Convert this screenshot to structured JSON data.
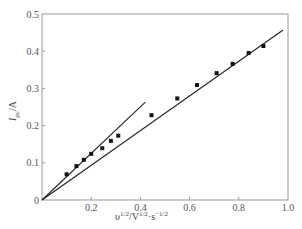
{
  "chart_data": {
    "type": "scatter",
    "title": "",
    "xlabel": "υ^1/2/V^1/2·s^-1/2",
    "ylabel": "I_pc/A",
    "xlabel_parts": {
      "base": "υ",
      "sup1": "1/2",
      "mid": "/V",
      "sup2": "1/2",
      "mid2": "·s",
      "sup3": "−1/2"
    },
    "ylabel_parts": {
      "base": "I",
      "sub": "pc",
      "unit": "/A"
    },
    "xlim": [
      0,
      1.0
    ],
    "ylim": [
      0,
      0.5
    ],
    "xticks": [
      "0",
      "0.2",
      "0.4",
      "0.6",
      "0.8",
      "1.0"
    ],
    "yticks": [
      "0",
      "0.1",
      "0.2",
      "0.3",
      "0.4",
      "0.5"
    ],
    "grid": false,
    "series": [
      {
        "name": "data points",
        "marker": "square",
        "x": [
          0.1,
          0.14,
          0.17,
          0.2,
          0.245,
          0.28,
          0.31,
          0.445,
          0.55,
          0.63,
          0.71,
          0.775,
          0.84,
          0.9
        ],
        "y": [
          0.069,
          0.091,
          0.108,
          0.124,
          0.139,
          0.159,
          0.173,
          0.228,
          0.273,
          0.309,
          0.341,
          0.366,
          0.395,
          0.414
        ]
      },
      {
        "name": "fit line (low scan rate)",
        "type": "line",
        "x": [
          0,
          0.42
        ],
        "y": [
          0,
          0.263
        ]
      },
      {
        "name": "fit line (high scan rate)",
        "type": "line",
        "x": [
          0,
          0.98
        ],
        "y": [
          0,
          0.457
        ]
      }
    ]
  }
}
